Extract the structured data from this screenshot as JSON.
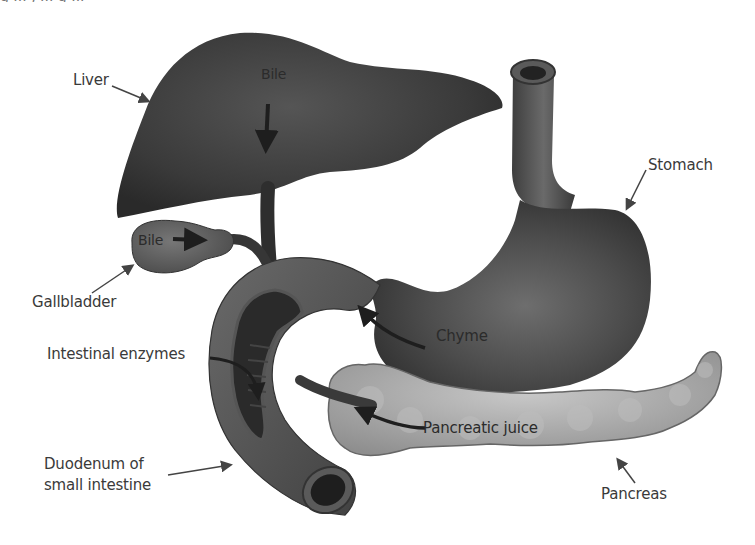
{
  "figure": {
    "top_cutoff_text": "g ... , ... g ..."
  },
  "labels": {
    "liver": "Liver",
    "bile_liver": "Bile",
    "bile_gallbladder": "Bile",
    "gallbladder": "Gallbladder",
    "stomach": "Stomach",
    "chyme": "Chyme",
    "intestinal_enzymes": "Intestinal enzymes",
    "pancreatic_juice": "Pancreatic juice",
    "duodenum_line1": "Duodenum of",
    "duodenum_line2": "small intestine",
    "pancreas": "Pancreas"
  },
  "colors": {
    "background": "#ffffff",
    "liver": "#3c3c3c",
    "stomach": "#4a4a4a",
    "pancreas": "#a9a9a9",
    "duodenum": "#555555",
    "text": "#3a3a3a",
    "arrow": "#222222"
  }
}
